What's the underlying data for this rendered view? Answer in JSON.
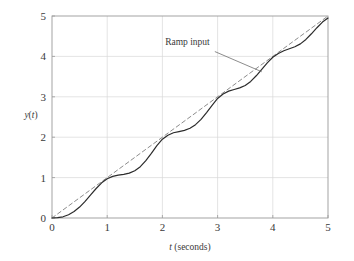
{
  "figure": {
    "background": "#ffffff",
    "frame_color": "#9a9a9a",
    "grid_color": "#d8d8d8"
  },
  "chart_data": {
    "type": "line",
    "title": "",
    "subtitle": "",
    "xlabel": "t (seconds)",
    "xlabel_italic_part": "t",
    "xlabel_rest": " (seconds)",
    "ylabel": "y(t)",
    "ylabel_italic_part": "y",
    "ylabel_paren_open": "(",
    "ylabel_italic_arg": "t",
    "ylabel_paren_close": ")",
    "xlim": [
      0,
      5
    ],
    "ylim": [
      0,
      5
    ],
    "xticks": [
      0,
      1,
      2,
      3,
      4,
      5
    ],
    "yticks": [
      0,
      1,
      2,
      3,
      4,
      5
    ],
    "xticklabels": [
      "0",
      "1",
      "2",
      "3",
      "4",
      "5"
    ],
    "yticklabels": [
      "0",
      "1",
      "2",
      "3",
      "4",
      "5"
    ],
    "grid": true,
    "grid_style": "solid-light",
    "legend": "none",
    "annotations": [
      {
        "text": "Ramp input",
        "x_data": 2.05,
        "y_data": 4.28,
        "leader_from": [
          2.95,
          4.12
        ],
        "leader_to": [
          3.8,
          3.62
        ],
        "target_series": "Ramp input"
      }
    ],
    "series": [
      {
        "name": "Ramp input",
        "style": "dashed",
        "color": "#8c8c8c",
        "width": 1.0,
        "x": [
          0,
          5
        ],
        "values": [
          0,
          5
        ]
      },
      {
        "name": "y(t) response",
        "style": "solid",
        "color": "#2b2b2b",
        "width": 1.2,
        "x": [
          0.0,
          0.1,
          0.2,
          0.3,
          0.4,
          0.5,
          0.6,
          0.7,
          0.8,
          0.9,
          1.0,
          1.1,
          1.2,
          1.3,
          1.4,
          1.5,
          1.6,
          1.7,
          1.8,
          1.9,
          2.0,
          2.1,
          2.2,
          2.3,
          2.4,
          2.5,
          2.6,
          2.7,
          2.8,
          2.9,
          3.0,
          3.1,
          3.2,
          3.3,
          3.4,
          3.5,
          3.6,
          3.7,
          3.8,
          3.9,
          4.0,
          4.1,
          4.2,
          4.3,
          4.4,
          4.5,
          4.6,
          4.7,
          4.8,
          4.9,
          5.0
        ],
        "values": [
          0.0,
          0.01,
          0.03,
          0.08,
          0.16,
          0.27,
          0.41,
          0.57,
          0.73,
          0.87,
          0.97,
          1.03,
          1.06,
          1.08,
          1.11,
          1.17,
          1.27,
          1.42,
          1.6,
          1.79,
          1.95,
          2.05,
          2.11,
          2.14,
          2.17,
          2.22,
          2.31,
          2.44,
          2.61,
          2.79,
          2.96,
          3.07,
          3.14,
          3.18,
          3.22,
          3.28,
          3.38,
          3.52,
          3.68,
          3.84,
          3.98,
          4.07,
          4.14,
          4.19,
          4.24,
          4.31,
          4.42,
          4.56,
          4.71,
          4.85,
          4.95
        ]
      }
    ]
  }
}
